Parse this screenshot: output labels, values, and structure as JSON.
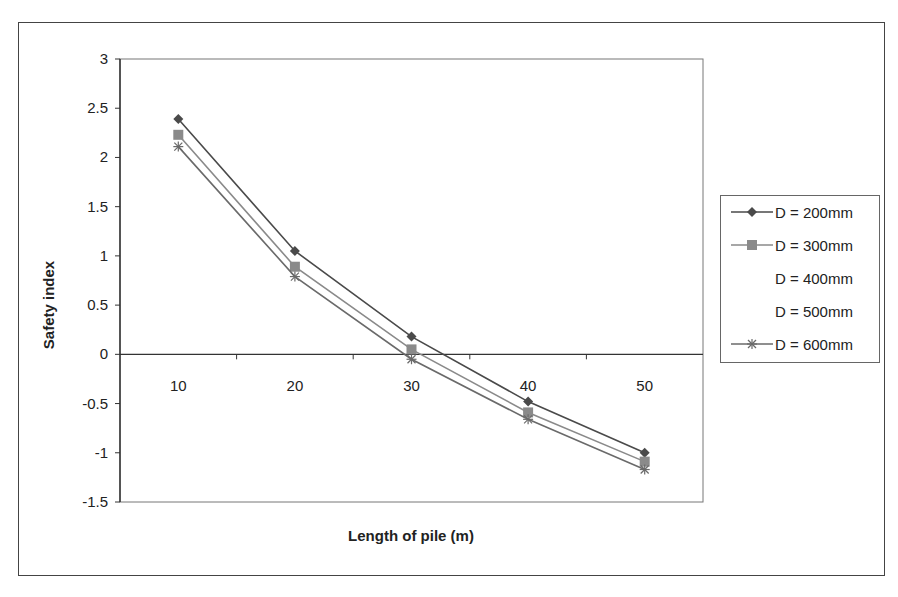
{
  "chart_data": {
    "type": "line",
    "title": "",
    "xlabel": "Length of pile (m)",
    "ylabel": "Safety index",
    "categories": [
      "10",
      "20",
      "30",
      "40",
      "50"
    ],
    "ylim": [
      -1.5,
      3
    ],
    "yticks": [
      "3",
      "2.5",
      "2",
      "1.5",
      "1",
      "0.5",
      "0",
      "-0.5",
      "-1",
      "-1.5"
    ],
    "grid": false,
    "legend_position": "right",
    "series": [
      {
        "name": "D = 200mm",
        "marker": "diamond",
        "color": "#4a4a4a",
        "values": [
          2.39,
          1.05,
          0.18,
          -0.48,
          -1.0
        ]
      },
      {
        "name": "D = 300mm",
        "marker": "square",
        "color": "#8a8a8a",
        "values": [
          2.23,
          0.89,
          0.05,
          -0.59,
          -1.09
        ]
      },
      {
        "name": "D = 600mm",
        "marker": "star",
        "color": "#6a6a6a",
        "values": [
          2.11,
          0.79,
          -0.05,
          -0.66,
          -1.17
        ]
      }
    ],
    "legend_only_entries": [
      "D = 400mm",
      "D = 500mm"
    ]
  },
  "legend": {
    "items": [
      {
        "label": "D = 200mm",
        "marker": "diamond",
        "color": "#4a4a4a",
        "visible": true
      },
      {
        "label": "D = 300mm",
        "marker": "square",
        "color": "#8a8a8a",
        "visible": true
      },
      {
        "label": "D = 400mm",
        "marker": "none",
        "color": "#ffffff",
        "visible": false
      },
      {
        "label": "D = 500mm",
        "marker": "none",
        "color": "#f0f0f0",
        "visible": false
      },
      {
        "label": "D = 600mm",
        "marker": "star",
        "color": "#6a6a6a",
        "visible": true
      }
    ]
  }
}
